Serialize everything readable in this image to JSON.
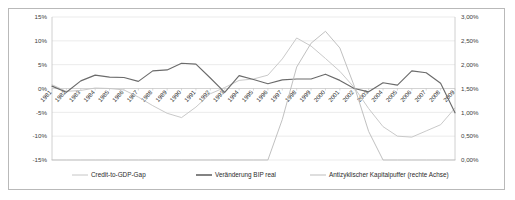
{
  "chart_data": {
    "type": "line",
    "title": "",
    "subtitle": "",
    "xlabel": "",
    "ylabel": "",
    "ylabel_right": "",
    "grid": true,
    "legend_position": "bottom",
    "x": [
      1981,
      1982,
      1983,
      1984,
      1985,
      1986,
      1987,
      1988,
      1989,
      1990,
      1991,
      1992,
      1993,
      1994,
      1995,
      1996,
      1997,
      1998,
      1999,
      2000,
      2001,
      2002,
      2003,
      2004,
      2005,
      2006,
      2007,
      2008,
      2009
    ],
    "xtick_labels": [
      "1981",
      "1982",
      "1983",
      "1984",
      "1985",
      "1986",
      "1987",
      "1988",
      "1989",
      "1990",
      "1991",
      "1992",
      "1993",
      "1994",
      "1995",
      "1996",
      "1997",
      "1998",
      "1999",
      "2000",
      "2001",
      "2002",
      "2003",
      "2004",
      "2005",
      "2006",
      "2007",
      "2008",
      "2009"
    ],
    "ylim": [
      -15,
      15
    ],
    "ytick_labels": [
      "15%",
      "10%",
      "5%",
      "0%",
      "-5%",
      "-10%",
      "-15%"
    ],
    "ytick_values": [
      15,
      10,
      5,
      0,
      -5,
      -10,
      -15
    ],
    "ylim_right": [
      0,
      3
    ],
    "ytick_labels_right": [
      "3,00%",
      "2,50%",
      "2,00%",
      "1,50%",
      "1,00%",
      "0,50%",
      "0,00%"
    ],
    "ytick_values_right": [
      3.0,
      2.5,
      2.0,
      1.5,
      1.0,
      0.5,
      0.0
    ],
    "series": [
      {
        "name": "Credit-to-GDP-Gap",
        "axis": "left",
        "color": "#c6c6c6",
        "values": [
          0.8,
          -0.6,
          -0.4,
          0.1,
          0.0,
          -0.3,
          -1.8,
          -3.6,
          -5.2,
          -6.1,
          -3.9,
          -1.1,
          0.2,
          1.7,
          2.0,
          2.8,
          6.2,
          10.6,
          8.9,
          6.3,
          3.6,
          0.2,
          -4.2,
          -8.0,
          -10.0,
          -10.2,
          -8.9,
          -7.6,
          -4.1
        ]
      },
      {
        "name": "Veränderung BIP real",
        "axis": "left",
        "color": "#6b6b6b",
        "values": [
          0.5,
          -0.8,
          1.6,
          2.8,
          2.4,
          2.3,
          1.5,
          3.7,
          3.9,
          5.3,
          5.1,
          2.2,
          -0.8,
          2.7,
          1.9,
          1.0,
          1.8,
          2.0,
          2.0,
          3.0,
          1.7,
          0.0,
          -0.7,
          1.2,
          0.7,
          3.7,
          3.3,
          1.1,
          -5.1
        ]
      },
      {
        "name": "Antizyklischer Kapitalpuffer (rechte Achse)",
        "axis": "right",
        "color": "#bdbdbd",
        "values": [
          0.0,
          0.0,
          0.0,
          0.0,
          0.0,
          0.0,
          0.0,
          0.0,
          0.0,
          0.0,
          0.0,
          0.0,
          0.0,
          0.0,
          0.0,
          0.0,
          0.85,
          1.95,
          2.45,
          2.7,
          2.35,
          1.55,
          0.6,
          0.0,
          0.0,
          0.0,
          0.0,
          0.0,
          0.0
        ]
      }
    ],
    "legend": [
      {
        "label": "Credit-to-GDP-Gap",
        "color": "#c6c6c6"
      },
      {
        "label": "Veränderung BIP real",
        "color": "#5a5a5a"
      },
      {
        "label": "Antizyklischer Kapitalpuffer (rechte Achse)",
        "color": "#bdbdbd"
      }
    ]
  }
}
